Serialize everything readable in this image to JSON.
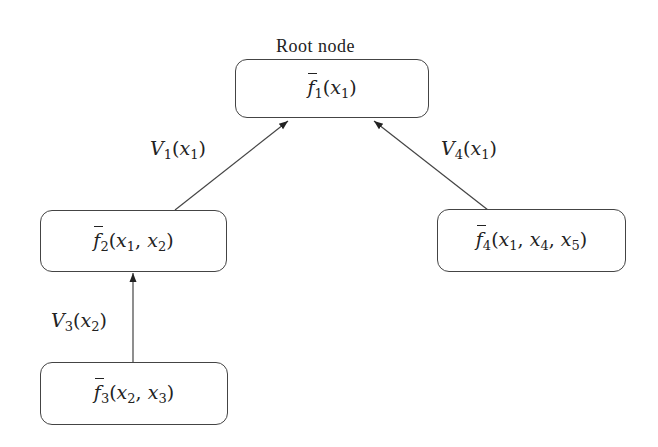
{
  "root_label": "Root node",
  "nodes": [
    {
      "id": "f1",
      "fn": "f",
      "sub": "1",
      "args": [
        {
          "v": "x",
          "s": "1"
        }
      ]
    },
    {
      "id": "f2",
      "fn": "f",
      "sub": "2",
      "args": [
        {
          "v": "x",
          "s": "1"
        },
        {
          "v": "x",
          "s": "2"
        }
      ]
    },
    {
      "id": "f3",
      "fn": "f",
      "sub": "3",
      "args": [
        {
          "v": "x",
          "s": "2"
        },
        {
          "v": "x",
          "s": "3"
        }
      ]
    },
    {
      "id": "f4",
      "fn": "f",
      "sub": "4",
      "args": [
        {
          "v": "x",
          "s": "1"
        },
        {
          "v": "x",
          "s": "4"
        },
        {
          "v": "x",
          "s": "5"
        }
      ]
    }
  ],
  "edges": [
    {
      "from": "f2",
      "to": "f1",
      "label": {
        "v": "V",
        "s": "1",
        "arg": "x",
        "argsub": "1"
      }
    },
    {
      "from": "f4",
      "to": "f1",
      "label": {
        "v": "V",
        "s": "4",
        "arg": "x",
        "argsub": "1"
      }
    },
    {
      "from": "f3",
      "to": "f2",
      "label": {
        "v": "V",
        "s": "3",
        "arg": "x",
        "argsub": "2"
      }
    }
  ]
}
